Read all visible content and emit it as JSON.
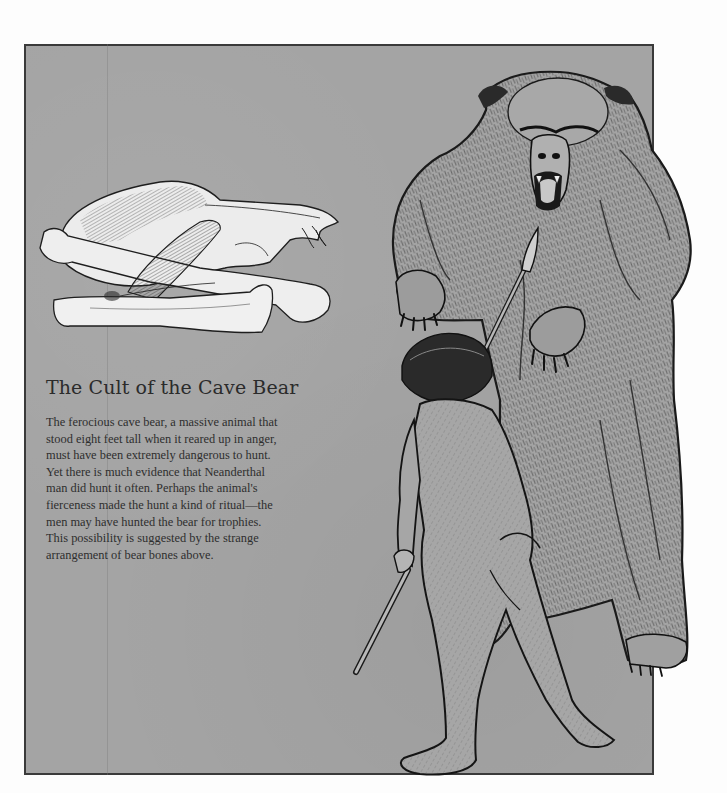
{
  "page": {
    "background_color": "#fdfdfd",
    "panel_color": "#a4a4a4",
    "border_color": "#3a3a3a",
    "ink_color": "#1e1e1e"
  },
  "illustrations": {
    "bones": "Cave bear skull resting on a pile of crossed bear long bones",
    "bear": "Rearing cave bear with open jaws and raised clawed forepaws",
    "hunter": "Neanderthal man seen from behind, holding a spear raised toward the bear"
  },
  "article": {
    "title": "The Cult of the Cave Bear",
    "lines": [
      "The ferocious cave bear, a massive animal that",
      "stood eight feet tall when it reared up in anger,",
      "must have been extremely dangerous to hunt.",
      "Yet there is much evidence that Neanderthal",
      "man did hunt it often. Perhaps the animal's",
      "fierceness made the hunt a kind of ritual—the",
      "men may have hunted the bear for trophies.",
      "This possibility is suggested by the strange",
      "arrangement of bear bones above."
    ]
  }
}
